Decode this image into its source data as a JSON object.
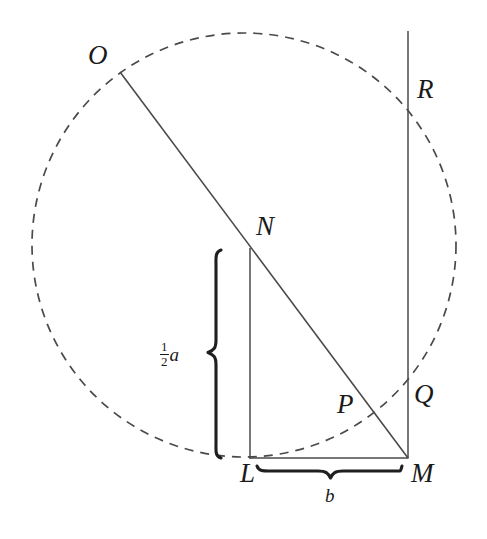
{
  "figure": {
    "background_color": "#ffffff",
    "stroke_color": "#3a3a3a",
    "label_color": "#1a1a1a",
    "width": 487,
    "height": 539,
    "points": [
      {
        "name": "O",
        "label": "O",
        "x": 120,
        "y": 72,
        "label_x": 88,
        "label_y": 42
      },
      {
        "name": "R",
        "label": "R",
        "x": 408,
        "y": 91,
        "label_x": 417,
        "label_y": 76
      },
      {
        "name": "N",
        "label": "N",
        "x": 250,
        "y": 248,
        "label_x": 256,
        "label_y": 213
      },
      {
        "name": "P",
        "label": "P",
        "x": 358,
        "y": 425,
        "label_x": 337,
        "label_y": 391
      },
      {
        "name": "Q",
        "label": "Q",
        "x": 408,
        "y": 383,
        "label_x": 414,
        "label_y": 381
      },
      {
        "name": "L",
        "label": "L",
        "x": 250,
        "y": 458,
        "label_x": 240,
        "label_y": 460
      },
      {
        "name": "M",
        "label": "M",
        "x": 408,
        "y": 458,
        "label_x": 411,
        "label_y": 460
      }
    ],
    "measures": [
      {
        "name": "half-a",
        "numerator": "1",
        "denominator": "2",
        "variable": "a",
        "label_x": 160,
        "label_y": 340
      },
      {
        "name": "b",
        "label": "b",
        "label_x": 325,
        "label_y": 486
      }
    ],
    "circle": {
      "center_x": 244,
      "center_y": 245,
      "radius": 212,
      "style": "dashed",
      "dash_pattern": "9 7"
    },
    "segments": [
      {
        "name": "segment-O-M",
        "x1": 120,
        "y1": 72,
        "x2": 408,
        "y2": 458,
        "style": "solid"
      },
      {
        "name": "segment-N-L",
        "x1": 250,
        "y1": 248,
        "x2": 250,
        "y2": 458,
        "style": "solid"
      },
      {
        "name": "segment-L-M",
        "x1": 250,
        "y1": 458,
        "x2": 408,
        "y2": 458,
        "style": "solid"
      },
      {
        "name": "vertical-line-R-M",
        "x1": 408,
        "y1": 31,
        "x2": 408,
        "y2": 458,
        "style": "solid"
      }
    ],
    "braces": [
      {
        "name": "brace-half-a",
        "orientation": "vertical",
        "start": 250,
        "end": 458,
        "axis": 218,
        "tip": 208
      },
      {
        "name": "brace-b",
        "orientation": "horizontal",
        "start": 257,
        "end": 402,
        "axis": 469,
        "tip": 479
      }
    ]
  }
}
